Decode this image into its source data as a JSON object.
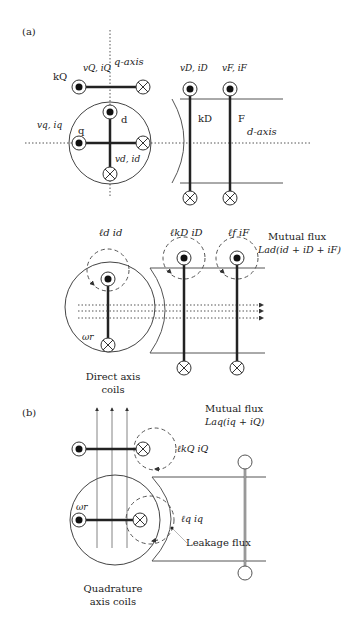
{
  "panels": {
    "a": {
      "label": "(a)",
      "top": {
        "q_axis_label": "q-axis",
        "d_axis_label": "d-axis",
        "kQ_label": "kQ",
        "kQ_vi": "vQ, iQ",
        "q_label": "q",
        "d_label": "d",
        "q_vi": "vq, iq",
        "d_vi": "vd, id",
        "kD_vi": "vD, iD",
        "F_vi": "vF, iF",
        "kD_label": "kD",
        "F_label": "F"
      },
      "bottom": {
        "ld_id": "ℓd id",
        "lkD_iD": "ℓkD iD",
        "lf_iF": "ℓf iF",
        "omega": "ωr",
        "mutual_flux": "Mutual flux",
        "mutual_expr": "Lad(id + iD + iF)",
        "caption_line1": "Direct axis",
        "caption_line2": "coils"
      }
    },
    "b": {
      "label": "(b)",
      "mutual_flux": "Mutual flux",
      "mutual_expr": "Laq(iq + iQ)",
      "lkQ_iQ": "ℓkQ iQ",
      "lq_iq": "ℓq iq",
      "omega": "ωr",
      "leakage": "Leakage flux",
      "caption_line1": "Quadrature",
      "caption_line2": "axis coils"
    }
  }
}
